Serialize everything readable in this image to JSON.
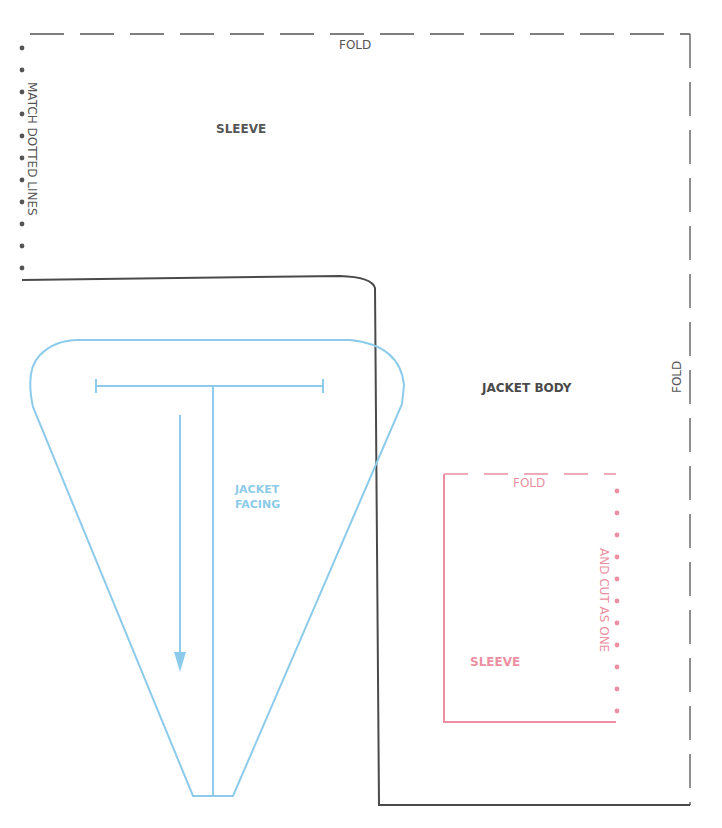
{
  "colors": {
    "black": "#4a4a4a",
    "dark": "#555555",
    "blue": "#8ccbea",
    "pink": "#ec8fa2"
  },
  "pieces": {
    "sleeve_top": {
      "label": "SLEEVE",
      "fold_top": "FOLD",
      "side_note": "MATCH DOTTED LINES",
      "match_dots": 11
    },
    "jacket_body": {
      "label": "JACKET BODY",
      "fold_right": "FOLD"
    },
    "jacket_facing": {
      "label_line1": "JACKET",
      "label_line2": "FACING"
    },
    "sleeve_inner": {
      "label": "SLEEVE",
      "fold_top": "FOLD",
      "side_note": "AND CUT AS ONE",
      "match_dots": 11
    }
  }
}
